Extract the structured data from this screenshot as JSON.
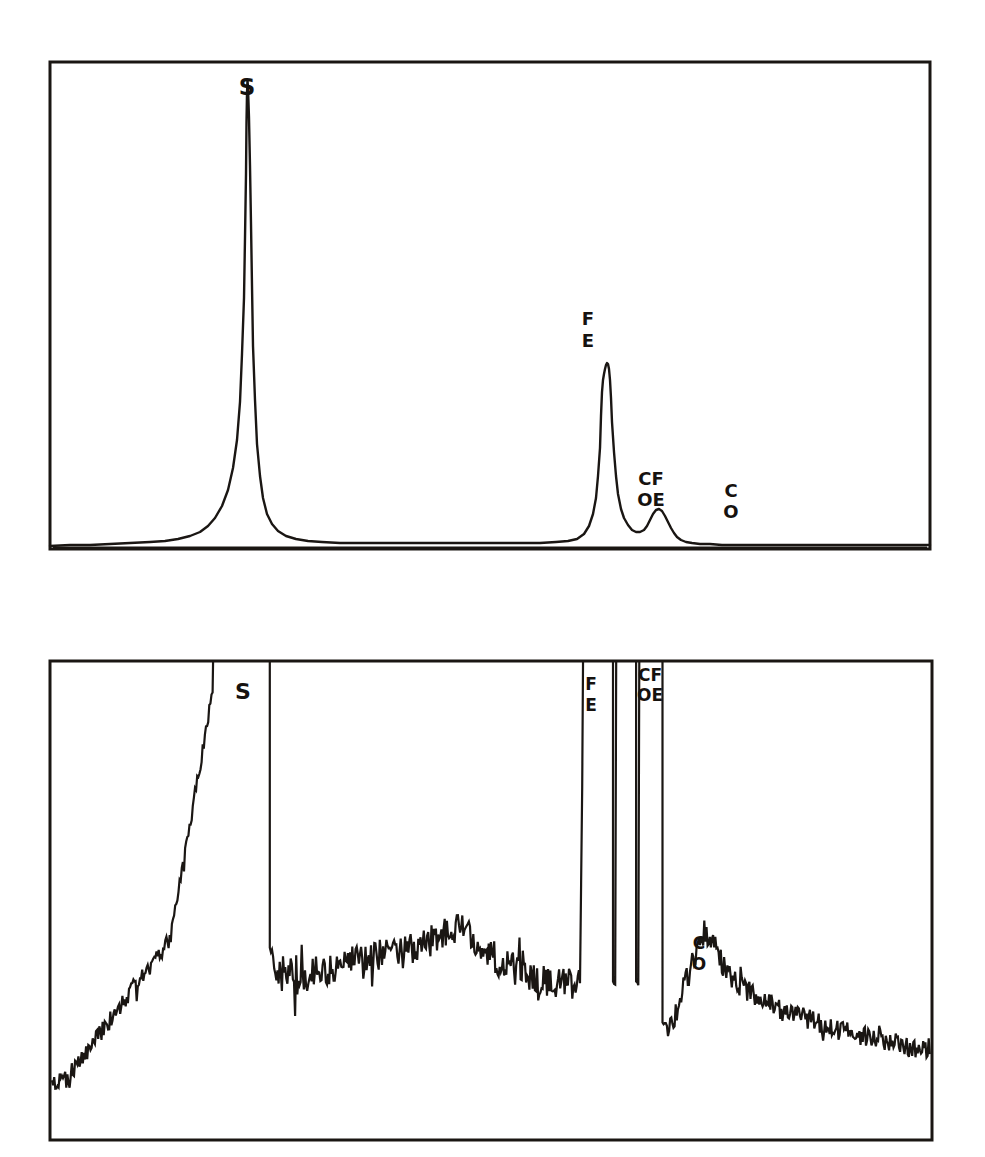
{
  "figure": {
    "background_color": "#ffffff",
    "ink_color": "#1a1613",
    "panels": [
      {
        "id": "top-panel",
        "name": "direct-spectrum-panel",
        "frame": {
          "x": 50,
          "y": 62,
          "width": 880,
          "height": 487
        },
        "description": "Smooth direct spectrum with tall sharp S peak, Fe peak, small CoFe shoulder and Co marker"
      },
      {
        "id": "bottom-panel",
        "name": "amplified-noise-spectrum-panel",
        "frame": {
          "x": 50,
          "y": 661,
          "width": 882,
          "height": 479
        },
        "description": "High-gain noisy spectrum with clipped off-scale peaks for S, Fe and CoFe, plus a resolved Co bump"
      }
    ],
    "peak_labels": [
      {
        "panel": "top-panel",
        "text": "S",
        "element": "sulfur",
        "x": 247,
        "y": 88,
        "stacked": false
      },
      {
        "panel": "top-panel",
        "text": "FE",
        "element": "iron",
        "lines": [
          "F",
          "E"
        ],
        "x": 588,
        "y": 320,
        "stacked": true
      },
      {
        "panel": "top-panel",
        "text": "CO FE",
        "element": "cobalt-iron",
        "lines": [
          "CF",
          "OE"
        ],
        "x": 641,
        "y": 480,
        "stacked": true
      },
      {
        "panel": "top-panel",
        "text": "CO",
        "element": "cobalt",
        "lines": [
          "C",
          "O"
        ],
        "x": 729,
        "y": 494,
        "stacked": true
      },
      {
        "panel": "bottom-panel",
        "text": "S",
        "element": "sulfur",
        "x": 243,
        "y": 690,
        "stacked": false
      },
      {
        "panel": "bottom-panel",
        "text": "FE",
        "element": "iron",
        "lines": [
          "F",
          "E"
        ],
        "x": 588,
        "y": 675,
        "stacked": true
      },
      {
        "panel": "bottom-panel",
        "text": "CO FE",
        "element": "cobalt-iron",
        "lines": [
          "CF",
          "OE"
        ],
        "x": 640,
        "y": 667,
        "stacked": true
      },
      {
        "panel": "bottom-panel",
        "text": "CO",
        "element": "cobalt",
        "lines": [
          "C",
          "O"
        ],
        "x": 697,
        "y": 944,
        "stacked": true
      }
    ]
  },
  "chart_data": [
    {
      "type": "line",
      "id": "top-panel",
      "title": "",
      "xlabel": "",
      "ylabel": "",
      "grid": false,
      "legend": "none",
      "xlim": [
        0,
        880
      ],
      "ylim": [
        0,
        487
      ],
      "notes": "Intensity vs kinetic energy; baseline flat near bottom of frame",
      "annotations": [
        "S",
        "FE",
        "CO FE",
        "CO"
      ],
      "series": [
        {
          "name": "direct-spectrum",
          "points": [
            [
              0,
              484
            ],
            [
              20,
              483
            ],
            [
              40,
              483
            ],
            [
              60,
              482
            ],
            [
              80,
              481
            ],
            [
              100,
              480
            ],
            [
              115,
              479
            ],
            [
              128,
              477
            ],
            [
              140,
              474
            ],
            [
              150,
              470
            ],
            [
              158,
              464
            ],
            [
              165,
              456
            ],
            [
              172,
              444
            ],
            [
              178,
              428
            ],
            [
              183,
              406
            ],
            [
              187,
              378
            ],
            [
              190,
              340
            ],
            [
              192,
              292
            ],
            [
              194,
              236
            ],
            [
              195,
              176
            ],
            [
              196,
              112
            ],
            [
              196.5,
              60
            ],
            [
              197,
              32
            ],
            [
              197.5,
              18
            ],
            [
              198,
              26
            ],
            [
              199,
              56
            ],
            [
              200,
              104
            ],
            [
              201,
              162
            ],
            [
              202,
              224
            ],
            [
              203,
              284
            ],
            [
              205,
              338
            ],
            [
              207,
              382
            ],
            [
              210,
              414
            ],
            [
              213,
              436
            ],
            [
              217,
              452
            ],
            [
              222,
              462
            ],
            [
              228,
              469
            ],
            [
              236,
              474
            ],
            [
              246,
              477
            ],
            [
              258,
              479
            ],
            [
              272,
              480
            ],
            [
              290,
              481
            ],
            [
              310,
              481
            ],
            [
              330,
              481
            ],
            [
              352,
              481
            ],
            [
              376,
              481
            ],
            [
              400,
              481
            ],
            [
              424,
              481
            ],
            [
              448,
              481
            ],
            [
              470,
              481
            ],
            [
              490,
              481
            ],
            [
              506,
              480
            ],
            [
              518,
              479
            ],
            [
              527,
              477
            ],
            [
              534,
              472
            ],
            [
              539,
              464
            ],
            [
              543,
              452
            ],
            [
              546,
              436
            ],
            [
              548,
              414
            ],
            [
              550,
              386
            ],
            [
              551,
              354
            ],
            [
              552,
              330
            ],
            [
              553,
              318
            ],
            [
              554,
              312
            ],
            [
              555,
              307
            ],
            [
              556,
              303
            ],
            [
              557,
              301
            ],
            [
              558,
              302
            ],
            [
              559,
              307
            ],
            [
              560,
              318
            ],
            [
              561,
              336
            ],
            [
              562,
              360
            ],
            [
              564,
              390
            ],
            [
              566,
              414
            ],
            [
              568,
              432
            ],
            [
              571,
              447
            ],
            [
              574,
              456
            ],
            [
              578,
              463
            ],
            [
              582,
              468
            ],
            [
              586,
              470
            ],
            [
              590,
              470
            ],
            [
              594,
              468
            ],
            [
              597,
              464
            ],
            [
              600,
              458
            ],
            [
              603,
              452
            ],
            [
              606,
              448
            ],
            [
              609,
              447
            ],
            [
              612,
              449
            ],
            [
              615,
              454
            ],
            [
              618,
              460
            ],
            [
              621,
              466
            ],
            [
              624,
              471
            ],
            [
              627,
              475
            ],
            [
              631,
              478
            ],
            [
              636,
              480
            ],
            [
              642,
              481
            ],
            [
              650,
              482
            ],
            [
              660,
              482
            ],
            [
              672,
              483
            ],
            [
              686,
              483
            ],
            [
              702,
              483
            ],
            [
              720,
              483
            ],
            [
              740,
              483
            ],
            [
              762,
              483
            ],
            [
              786,
              483
            ],
            [
              810,
              483
            ],
            [
              834,
              483
            ],
            [
              856,
              483
            ],
            [
              875,
              483
            ],
            [
              880,
              483
            ]
          ]
        }
      ]
    },
    {
      "type": "line",
      "id": "bottom-panel",
      "title": "",
      "xlabel": "",
      "ylabel": "",
      "grid": false,
      "legend": "none",
      "xlim": [
        0,
        882
      ],
      "ylim": [
        0,
        479
      ],
      "notes": "Same spectrum at high gain; S, Fe and CoFe peaks clipped off the top of the frame, strong statistical noise on the continuum",
      "annotations": [
        "S",
        "FE",
        "CO FE",
        "CO"
      ],
      "series": [
        {
          "name": "amplified-spectrum",
          "clipped_peaks_x": [
            163,
            219,
            533,
            563,
            586,
            612
          ],
          "baseline_right": 410
        }
      ]
    }
  ]
}
